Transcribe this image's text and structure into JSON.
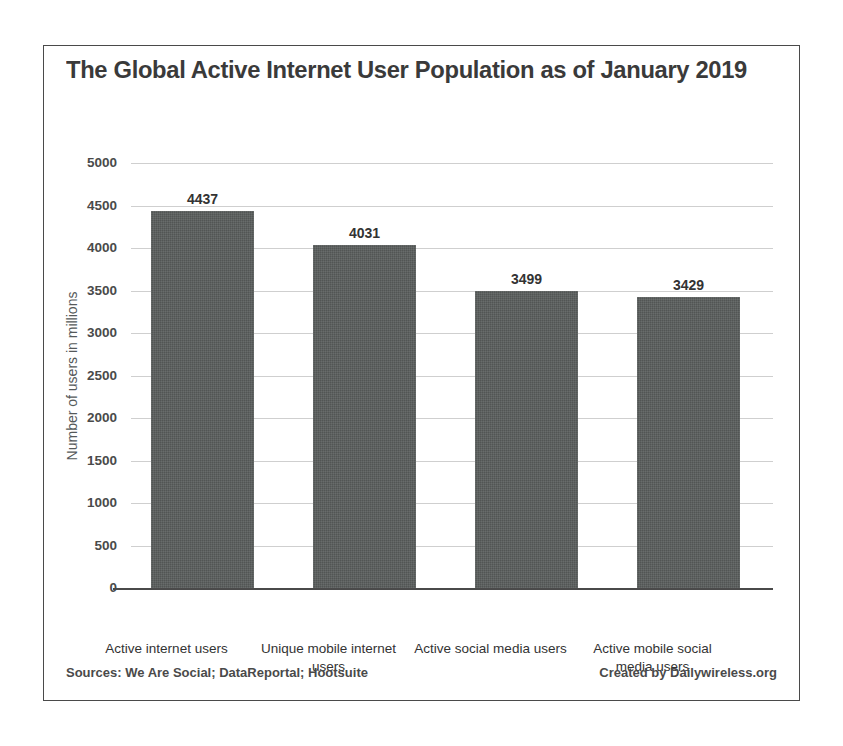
{
  "chart_data": {
    "type": "bar",
    "title": "The Global Active Internet User Population as of January 2019",
    "subtitle": "",
    "xlabel": "",
    "ylabel": "Number of users in millions",
    "categories": [
      "Active internet users",
      "Unique mobile internet users",
      "Active social media users",
      "Active mobile social media users"
    ],
    "values": [
      4437,
      4031,
      3499,
      3429
    ],
    "value_labels": [
      "4437",
      "4031",
      "3499",
      "3429"
    ],
    "ylim": [
      0,
      5000
    ],
    "ytick_step": 500,
    "ytick_labels": [
      "5000",
      "4500",
      "4000",
      "3500",
      "3000",
      "2500",
      "2000",
      "1500",
      "1000",
      "500",
      "0"
    ],
    "grid": true,
    "grid_axis": "y",
    "legend": false,
    "legend_position": "none",
    "bar_color": "#595d5c",
    "grid_color": "#cfcfcf",
    "axis_color": "#4a4a4a",
    "text_color": "#3b3b3b"
  },
  "footer": {
    "sources": "Sources: We Are Social; DataReportal; Hootsuite",
    "credit": "Created by Dailywireless.org"
  }
}
